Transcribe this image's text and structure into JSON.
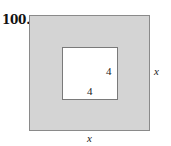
{
  "problem_number": "100.",
  "figure": {
    "outer_square": {
      "side_label_right": "x",
      "side_label_bottom": "x",
      "fill": "#d4d4d4"
    },
    "inner_square": {
      "side_label_right": "4",
      "side_label_bottom": "4",
      "fill": "#ffffff"
    }
  }
}
